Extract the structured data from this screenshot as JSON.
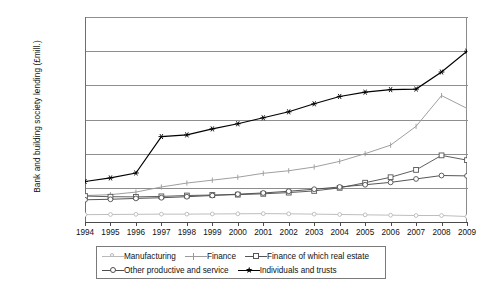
{
  "axis": {
    "y_title": "Bank and building society lending (£mill.)",
    "y_ticks": [
      "1,200,000",
      "1,000,000",
      "800,000",
      "600,000",
      "400,000",
      "200,000",
      "0"
    ]
  },
  "legend": {
    "rows": [
      [
        {
          "label": "Manufacturing",
          "marker": "circle-sm",
          "color": "#b9b9b9"
        },
        {
          "label": "Finance",
          "marker": "tick",
          "color": "#9a9a9a"
        },
        {
          "label": "Finance of which real estate",
          "marker": "square",
          "color": "#555555"
        }
      ],
      [
        {
          "label": "Other productive and service",
          "marker": "circle",
          "color": "#4d4d4d"
        },
        {
          "label": "Individuals and trusts",
          "marker": "star",
          "color": "#000000"
        }
      ]
    ]
  },
  "chart_data": {
    "type": "line",
    "title": "",
    "xlabel": "",
    "ylabel": "Bank and building society lending (£mill.)",
    "ylim": [
      0,
      1200000
    ],
    "ytick_interval": 200000,
    "grid": true,
    "legend_position": "bottom",
    "categories": [
      1994,
      1995,
      1996,
      1997,
      1998,
      1999,
      2000,
      2001,
      2002,
      2003,
      2004,
      2005,
      2006,
      2007,
      2008,
      2009
    ],
    "series": [
      {
        "name": "Manufacturing",
        "color": "#b9b9b9",
        "marker": "circle-sm",
        "values": [
          43000,
          44000,
          45000,
          46000,
          46000,
          47000,
          48000,
          49000,
          48000,
          46000,
          44000,
          42000,
          40000,
          38000,
          38000,
          32000
        ]
      },
      {
        "name": "Finance",
        "color": "#9a9a9a",
        "marker": "tick",
        "values": [
          155000,
          160000,
          175000,
          205000,
          228000,
          245000,
          262000,
          285000,
          300000,
          322000,
          355000,
          400000,
          450000,
          560000,
          740000,
          665000
        ]
      },
      {
        "name": "Finance of which real estate",
        "color": "#555555",
        "marker": "square",
        "values": [
          152000,
          148000,
          147000,
          150000,
          155000,
          158000,
          160000,
          165000,
          172000,
          182000,
          200000,
          230000,
          262000,
          305000,
          390000,
          362000
        ]
      },
      {
        "name": "Other productive and service",
        "color": "#4d4d4d",
        "marker": "circle",
        "values": [
          130000,
          133000,
          138000,
          142000,
          148000,
          155000,
          163000,
          170000,
          180000,
          192000,
          205000,
          218000,
          232000,
          252000,
          272000,
          270000
        ]
      },
      {
        "name": "Individuals and trusts",
        "color": "#000000",
        "marker": "star",
        "values": [
          237000,
          258000,
          287000,
          500000,
          510000,
          545000,
          575000,
          610000,
          645000,
          692000,
          735000,
          760000,
          775000,
          778000,
          878000,
          1000000
        ]
      }
    ]
  }
}
